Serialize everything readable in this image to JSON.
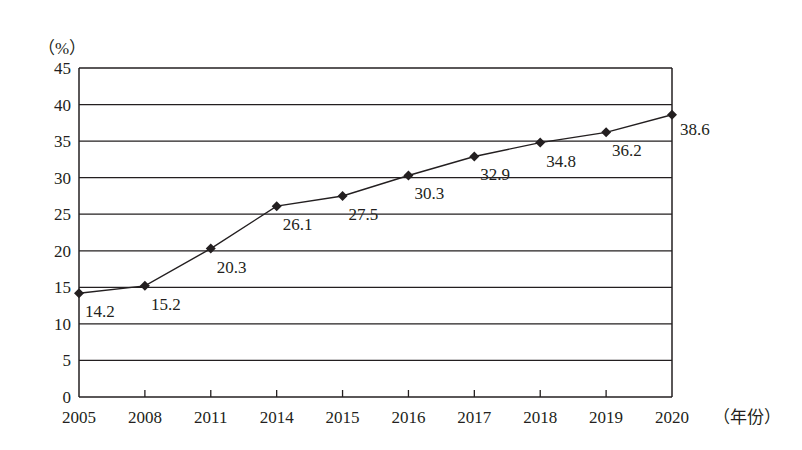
{
  "chart_data": {
    "type": "line",
    "title": "",
    "xlabel": "（年份）",
    "ylabel": "（%）",
    "categories": [
      "2005",
      "2008",
      "2011",
      "2014",
      "2015",
      "2016",
      "2017",
      "2018",
      "2019",
      "2020"
    ],
    "series": [
      {
        "name": "",
        "values": [
          14.2,
          15.2,
          20.3,
          26.1,
          27.5,
          30.3,
          32.9,
          34.8,
          36.2,
          38.6
        ]
      }
    ],
    "ylim": [
      0,
      45
    ],
    "yticks": [
      0,
      5,
      10,
      15,
      20,
      25,
      30,
      35,
      40,
      45
    ],
    "grid": "horizontal",
    "legend": "none",
    "marker": "diamond",
    "data_labels": true
  },
  "colors": {
    "line": "#231f20",
    "grid": "#231f20",
    "text": "#231f20"
  }
}
